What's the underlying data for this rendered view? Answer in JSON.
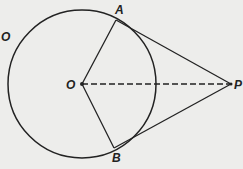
{
  "diagram": {
    "type": "geometry",
    "colors": {
      "stroke": "#222222",
      "background": "#ededeb"
    },
    "points": {
      "O": {
        "label": "O",
        "x": 82,
        "y": 84
      },
      "A": {
        "label": "A",
        "x": 116,
        "y": 20
      },
      "B": {
        "label": "B",
        "x": 114,
        "y": 148
      },
      "P": {
        "label": "P",
        "x": 231,
        "y": 84
      }
    },
    "circle": {
      "label": "O",
      "cx": 82,
      "cy": 84,
      "r": 74
    },
    "segments": [
      {
        "from": "O",
        "to": "A",
        "style": "solid"
      },
      {
        "from": "O",
        "to": "B",
        "style": "solid"
      },
      {
        "from": "A",
        "to": "P",
        "style": "solid"
      },
      {
        "from": "B",
        "to": "P",
        "style": "solid"
      },
      {
        "from": "O",
        "to": "P",
        "style": "dashed"
      }
    ]
  }
}
